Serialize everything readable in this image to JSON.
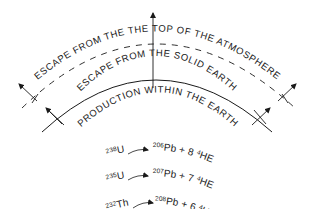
{
  "diagram": {
    "labels": {
      "atmosphere": "ESCAPE FROM THE THE TOP OF THE ATMOSPHERE",
      "solid_earth": "ESCAPE FROM THE SOLID EARTH",
      "production": "PRODUCTION WITHIN THE EARTH"
    },
    "reactions": [
      {
        "parent_mass": "238",
        "parent": "U",
        "product_mass": "206",
        "product": "Pb",
        "plus": "+",
        "count": "8",
        "he_mass": "4",
        "he": "HE"
      },
      {
        "parent_mass": "235",
        "parent": "U",
        "product_mass": "207",
        "product": "Pb",
        "plus": "+",
        "count": "7",
        "he_mass": "4",
        "he": "HE"
      },
      {
        "parent_mass": "232",
        "parent": "Th",
        "product_mass": "208",
        "product": "Pb",
        "plus": "+",
        "count": "6",
        "he_mass": "4",
        "he": "HE"
      }
    ],
    "colors": {
      "ink": "#1a1a1a",
      "background": "#ffffff"
    }
  }
}
